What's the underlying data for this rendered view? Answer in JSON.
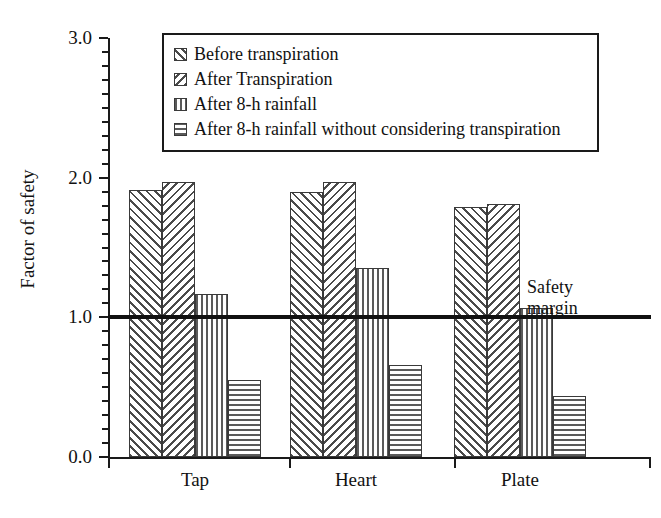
{
  "chart_data": {
    "type": "bar",
    "title": "",
    "xlabel": "",
    "ylabel": "Factor of safety",
    "categories": [
      "Tap",
      "Heart",
      "Plate"
    ],
    "ylim": [
      0.0,
      3.0
    ],
    "ytick_labels": [
      "0.0",
      "1.0",
      "2.0",
      "3.0"
    ],
    "ytick_values": [
      0.0,
      1.0,
      2.0,
      3.0
    ],
    "minor_tick_step": 0.2,
    "grid": false,
    "legend_position": "top-center-inside",
    "series": [
      {
        "name": "Before transpiration",
        "pattern": "diagonal-forward",
        "values": [
          1.91,
          1.9,
          1.79
        ]
      },
      {
        "name": "After Transpiration",
        "pattern": "diagonal-backward",
        "values": [
          1.97,
          1.97,
          1.81
        ]
      },
      {
        "name": "After 8-h rainfall",
        "pattern": "vertical",
        "values": [
          1.17,
          1.35,
          1.07
        ]
      },
      {
        "name": "After 8-h rainfall without considering transpiration",
        "pattern": "horizontal",
        "values": [
          0.55,
          0.66,
          0.44
        ]
      }
    ],
    "annotations": [
      {
        "name": "safety-margin",
        "text": "Safety\nmargin",
        "y_value": 1.0,
        "line": true
      }
    ]
  },
  "colors": {
    "axis": "#1a1a1a",
    "hatch": "#4a4a4a",
    "background": "#ffffff",
    "safety_line": "#111111"
  }
}
